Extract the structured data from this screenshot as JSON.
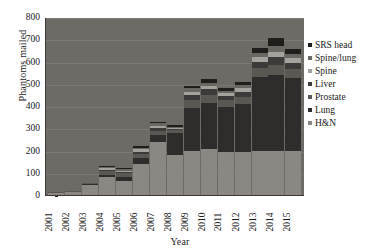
{
  "chart_data": {
    "type": "bar",
    "title": "",
    "subtitle": "",
    "xlabel": "Year",
    "ylabel": "Phantoms mailed",
    "ylim": [
      0,
      800
    ],
    "yticks": [
      0,
      100,
      200,
      300,
      400,
      500,
      600,
      700,
      800
    ],
    "grid": true,
    "stacked": true,
    "legend_position": "right",
    "categories": [
      "2001",
      "2002",
      "2003",
      "2004",
      "2005",
      "2006",
      "2007",
      "2008",
      "2009",
      "2010",
      "2011",
      "2012",
      "2013",
      "2014",
      "2015"
    ],
    "series": [
      {
        "name": "H&N",
        "color": "#8b8884",
        "values": [
          10,
          12,
          45,
          80,
          65,
          140,
          240,
          180,
          200,
          205,
          195,
          195,
          200,
          200,
          200
        ]
      },
      {
        "name": "Lung",
        "color": "#2f2d2b",
        "values": [
          0,
          0,
          5,
          12,
          18,
          25,
          30,
          100,
          190,
          210,
          200,
          215,
          330,
          340,
          325
        ]
      },
      {
        "name": "Prostate",
        "color": "#5b5854",
        "values": [
          5,
          4,
          5,
          15,
          15,
          20,
          20,
          10,
          35,
          35,
          30,
          30,
          40,
          45,
          40
        ]
      },
      {
        "name": "Liver",
        "color": "#3d3b39",
        "values": [
          0,
          0,
          0,
          6,
          6,
          10,
          12,
          8,
          25,
          25,
          20,
          25,
          30,
          35,
          30
        ]
      },
      {
        "name": "Spine",
        "color": "#a5a29e",
        "values": [
          0,
          0,
          0,
          8,
          6,
          10,
          10,
          5,
          15,
          15,
          12,
          15,
          20,
          25,
          20
        ]
      },
      {
        "name": "Spine/lung",
        "color": "#6a6763",
        "values": [
          0,
          0,
          0,
          5,
          5,
          8,
          10,
          5,
          15,
          15,
          12,
          15,
          20,
          25,
          20
        ]
      },
      {
        "name": "SRS head",
        "color": "#1f1e1d",
        "values": [
          0,
          0,
          0,
          4,
          5,
          7,
          8,
          5,
          10,
          15,
          11,
          15,
          20,
          35,
          20
        ]
      }
    ],
    "totals": [
      15,
      16,
      55,
      130,
      120,
      220,
      330,
      313,
      490,
      520,
      480,
      510,
      660,
      705,
      655
    ],
    "legend": [
      "SRS head",
      "Spine/lung",
      "Spine",
      "Liver",
      "Prostate",
      "Lung",
      "H&N"
    ],
    "plot_background": "#6e6b67",
    "grid_color": "#7d7a76",
    "axis_color": "#3a3a3a",
    "text_color": "#1a1a1a"
  }
}
